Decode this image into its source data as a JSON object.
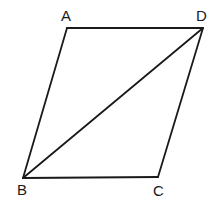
{
  "figure": {
    "name": "parallelogram-with-diagonal",
    "canvas": {
      "width": 219,
      "height": 206,
      "background": "#ffffff"
    },
    "stroke": {
      "color": "#1a1a1a",
      "width": 1.8
    },
    "label_color": "#1a1a1a",
    "vertices": [
      {
        "id": "A",
        "label": "A",
        "x": 67,
        "y": 28,
        "label_x": 61,
        "label_y": 8
      },
      {
        "id": "D",
        "label": "D",
        "x": 203,
        "y": 28,
        "label_x": 196,
        "label_y": 8
      },
      {
        "id": "B",
        "label": "B",
        "x": 23,
        "y": 178,
        "label_x": 17,
        "label_y": 182
      },
      {
        "id": "C",
        "label": "C",
        "x": 158,
        "y": 177,
        "label_x": 153,
        "label_y": 183
      }
    ],
    "edges": [
      {
        "id": "AD",
        "from": "A",
        "to": "D",
        "kind": "side"
      },
      {
        "id": "AB",
        "from": "A",
        "to": "B",
        "kind": "side"
      },
      {
        "id": "BC",
        "from": "B",
        "to": "C",
        "kind": "side"
      },
      {
        "id": "CD",
        "from": "C",
        "to": "D",
        "kind": "side"
      },
      {
        "id": "BD",
        "from": "B",
        "to": "D",
        "kind": "diagonal"
      }
    ],
    "polygon_points": "67,28 203,28 158,177 23,178",
    "diagonal_points": "23,178 203,28"
  }
}
